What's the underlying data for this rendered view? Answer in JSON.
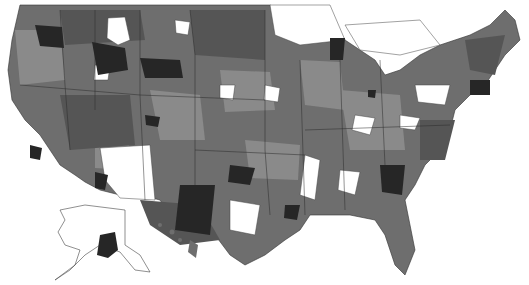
{
  "map": {
    "type": "choropleth",
    "subject": "United States by region (grayscale shading)",
    "legend": null,
    "palette": {
      "none": "#ffffff",
      "low": "#8a8a8a",
      "mid": "#6e6e6e",
      "high": "#5a5a5a",
      "highest": "#262626",
      "border": "#2a2a2a"
    },
    "insets": [
      "alaska",
      "hawaii"
    ]
  }
}
